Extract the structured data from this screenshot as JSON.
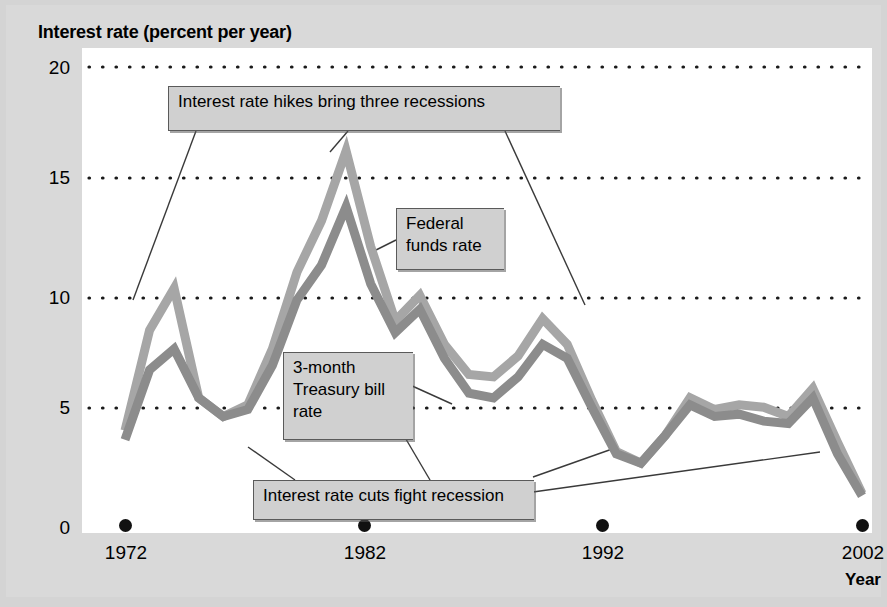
{
  "chart_data": {
    "type": "line",
    "title": "Interest rate (percent per year)",
    "xlabel": "Year",
    "ylabel": "Interest rate (percent per year)",
    "xlim": [
      1972,
      2002
    ],
    "ylim": [
      0,
      20
    ],
    "grid": true,
    "grid_style": "dotted-horizontal",
    "legend": "inline-labels",
    "y_ticks": [
      "0",
      "5",
      "10",
      "15",
      "20"
    ],
    "y_tick_values": [
      0,
      5,
      10,
      15,
      20
    ],
    "x_ticks": [
      "1972",
      "1982",
      "1992",
      "2002"
    ],
    "x_tick_values": [
      1972,
      1982,
      1992,
      2002
    ],
    "x": [
      1972,
      1973,
      1974,
      1975,
      1976,
      1977,
      1978,
      1979,
      1980,
      1981,
      1982,
      1983,
      1984,
      1985,
      1986,
      1987,
      1988,
      1989,
      1990,
      1991,
      1992,
      1993,
      1994,
      1995,
      1996,
      1997,
      1998,
      1999,
      2000,
      2001,
      2002
    ],
    "series": [
      {
        "name": "Federal funds rate",
        "color": "#a6a6a6",
        "values": [
          4.4,
          8.7,
          10.5,
          5.8,
          5.0,
          5.5,
          7.9,
          11.2,
          13.4,
          16.4,
          12.3,
          9.1,
          10.2,
          8.1,
          6.8,
          6.7,
          7.6,
          9.2,
          8.1,
          5.7,
          3.5,
          3.0,
          4.2,
          5.8,
          5.3,
          5.5,
          5.4,
          5.0,
          6.2,
          3.9,
          1.7
        ]
      },
      {
        "name": "3-month Treasury bill rate",
        "color": "#8c8c8c",
        "values": [
          4.0,
          7.0,
          7.9,
          5.8,
          5.0,
          5.3,
          7.2,
          10.0,
          11.5,
          14.0,
          10.7,
          8.6,
          9.6,
          7.5,
          6.0,
          5.8,
          6.7,
          8.1,
          7.5,
          5.4,
          3.4,
          3.0,
          4.2,
          5.5,
          5.0,
          5.1,
          4.8,
          4.7,
          5.8,
          3.4,
          1.6
        ]
      }
    ],
    "annotations": [
      {
        "id": "hikes",
        "text": "Interest rate hikes bring three recessions"
      },
      {
        "id": "cuts",
        "text": "Interest rate cuts fight recession"
      },
      {
        "id": "fed-funds",
        "text": "Federal\nfunds rate"
      },
      {
        "id": "tbill",
        "text": "3-month\nTreasury bill\nrate"
      }
    ],
    "colors": {
      "background": "#d9d9d9",
      "plot_background": "#ffffff",
      "gridline": "#1a1a1a",
      "callout_fill": "#d0d0d0",
      "callout_border": "#5a5a5a",
      "federal_funds": "#a6a6a6",
      "treasury_bill": "#8c8c8c"
    }
  }
}
